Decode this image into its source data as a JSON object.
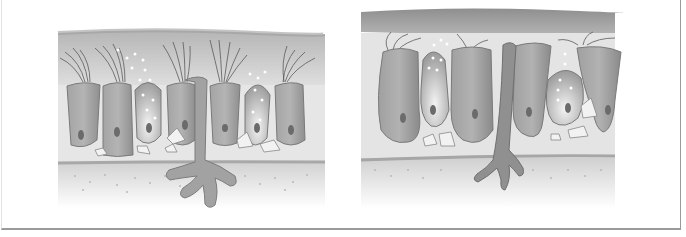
{
  "figure": {
    "panels": [
      {
        "id": "left",
        "label": "",
        "state": "normal epithelium with intact cilia"
      },
      {
        "id": "right",
        "label": "",
        "state": "damaged epithelium with sparse cilia and swollen cells"
      }
    ],
    "colors": {
      "background": "#ffffff",
      "frame": "#9a9a9a",
      "mucus_layer": "#a9a9a9",
      "cell_fill": "#9c9c9c",
      "cell_stroke": "#7a7a7a",
      "nucleus": "#6a6a6a",
      "basement": "#c8c8c8",
      "connective": "#dcdcdc"
    }
  }
}
